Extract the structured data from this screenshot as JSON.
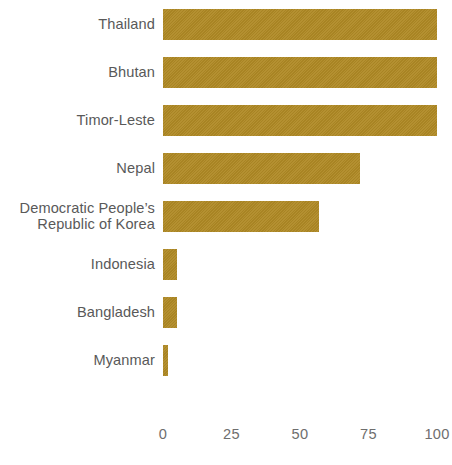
{
  "chart_data": {
    "type": "bar",
    "orientation": "horizontal",
    "title": "",
    "subtitle": "",
    "xlabel": "",
    "ylabel": "",
    "categories": [
      "Thailand",
      "Bhutan",
      "Timor-Leste",
      "Democratic People’s\nRepublic of Korea",
      "Nepal",
      "Indonesia",
      "Bangladesh",
      "Myanmar"
    ],
    "values": [
      100,
      100,
      100,
      57,
      72,
      5,
      5,
      2
    ],
    "xlim": [
      0,
      100
    ],
    "xticks": [
      0,
      25,
      50,
      75,
      100
    ],
    "xtick_labels": [
      "0",
      "25",
      "50",
      "75",
      "100"
    ],
    "grid": false,
    "legend": false,
    "bar_color": "#b08a25",
    "label_color": "#595959",
    "tick_color": "#6e6e6e",
    "background_color": "#ffffff"
  },
  "bars": [
    {
      "label": "Thailand",
      "value": 100
    },
    {
      "label": "Bhutan",
      "value": 100
    },
    {
      "label": "Timor-Leste",
      "value": 100
    },
    {
      "label": "Nepal",
      "value": 72
    },
    {
      "label": "Democratic People’s\nRepublic of Korea",
      "value": 57
    },
    {
      "label": "Indonesia",
      "value": 5
    },
    {
      "label": "Bangladesh",
      "value": 5
    },
    {
      "label": "Myanmar",
      "value": 2
    }
  ],
  "axis": {
    "ticks": [
      {
        "label": "0",
        "value": 0
      },
      {
        "label": "25",
        "value": 25
      },
      {
        "label": "50",
        "value": 50
      },
      {
        "label": "75",
        "value": 75
      },
      {
        "label": "100",
        "value": 100
      }
    ]
  }
}
